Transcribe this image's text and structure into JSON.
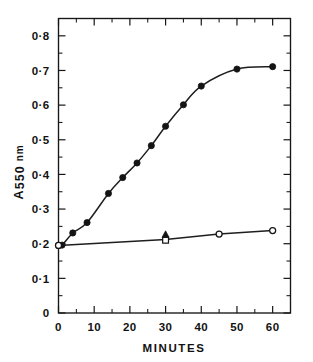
{
  "figure": {
    "background": "#ffffff",
    "ink_color": "#161616"
  },
  "chart_data": {
    "type": "line",
    "title": "",
    "subtitle": "",
    "xlabel": "MINUTES",
    "ylabel": "A550 nm",
    "ylabel_parts": {
      "symbol": "A",
      "subscript": "550",
      "unit": "nm"
    },
    "xlim": [
      0,
      65
    ],
    "ylim": [
      0,
      0.85
    ],
    "grid": false,
    "legend": "none",
    "legend_position": "none",
    "x_ticks_major": [
      0,
      10,
      20,
      30,
      40,
      50,
      60
    ],
    "x_ticks_major_labels": [
      "0",
      "10",
      "20",
      "30",
      "40",
      "50",
      "60"
    ],
    "x_ticks_minor": [
      5,
      15,
      25,
      35,
      45,
      55,
      65
    ],
    "y_ticks_major": [
      0,
      0.1,
      0.2,
      0.3,
      0.4,
      0.5,
      0.6,
      0.7,
      0.8
    ],
    "y_ticks_major_labels": [
      "0",
      "0·1",
      "0·2",
      "0·3",
      "0·4",
      "0·5",
      "0·6",
      "0·7",
      "0·8"
    ],
    "y_ticks_minor": [
      0.05,
      0.15,
      0.25,
      0.35,
      0.45,
      0.55,
      0.65,
      0.75,
      0.85
    ],
    "series": [
      {
        "name": "upper-curve-filled-circles",
        "marker": "filled-circle",
        "x": [
          0,
          1,
          4,
          8,
          14,
          18,
          22,
          26,
          30,
          35,
          40,
          50,
          60
        ],
        "values": [
          0.195,
          0.196,
          0.231,
          0.261,
          0.345,
          0.391,
          0.433,
          0.483,
          0.539,
          0.601,
          0.655,
          0.704,
          0.711
        ]
      },
      {
        "name": "lower-line-open-circles",
        "marker": "open-circle",
        "x": [
          0,
          30,
          45,
          60
        ],
        "values": [
          0.195,
          0.212,
          0.228,
          0.238
        ]
      },
      {
        "name": "lower-point-triangle",
        "marker": "filled-triangle",
        "x": [
          30
        ],
        "values": [
          0.226
        ]
      },
      {
        "name": "lower-point-square",
        "marker": "open-square",
        "x": [
          30
        ],
        "values": [
          0.21
        ]
      }
    ]
  }
}
